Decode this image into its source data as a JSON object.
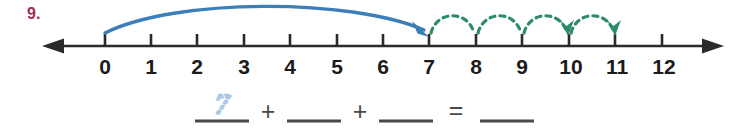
{
  "problem": {
    "number_label": "9.",
    "number_color": "#9e3052"
  },
  "numberline": {
    "min": 0,
    "max": 12,
    "tick_labels": [
      "0",
      "1",
      "2",
      "3",
      "4",
      "5",
      "6",
      "7",
      "8",
      "9",
      "10",
      "11",
      "12"
    ],
    "axis_color": "#2b2b2b",
    "left_arrow": true,
    "right_arrow": true
  },
  "jumps": {
    "big_jump": {
      "color": "#3b7eb8",
      "style": "solid",
      "from": 0,
      "to": 7,
      "label": "0 to 7",
      "arrowhead": "at-7"
    },
    "small_jumps": {
      "color": "#2e8b6e",
      "style": "dashed",
      "count": 4,
      "from": 7,
      "to": 11,
      "hops": [
        {
          "from": 7,
          "to": 8
        },
        {
          "from": 8,
          "to": 9
        },
        {
          "from": 9,
          "to": 10
        },
        {
          "from": 10,
          "to": 11
        }
      ]
    }
  },
  "equation": {
    "traced_answer": "7",
    "traced_color": "#a8c8e6",
    "plus_sign": "+",
    "equals_sign": "=",
    "blank_count": 4,
    "blank_color": "#4a4a4a",
    "blanks": [
      "",
      "",
      "",
      ""
    ]
  }
}
